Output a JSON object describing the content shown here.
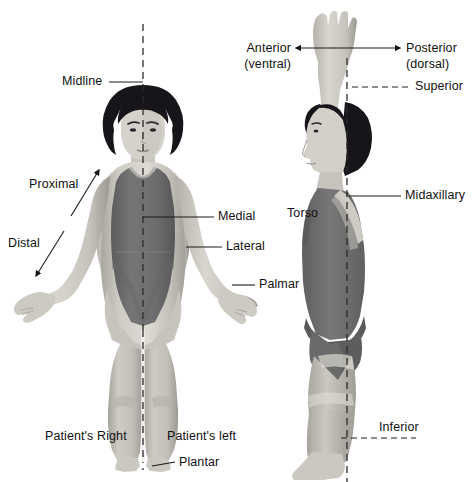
{
  "figure": {
    "background_color": "#ffffff",
    "text_color": "#111111",
    "line_color": "#1a1a1a",
    "skin_light": "#d8d5cf",
    "skin_mid": "#bfbcb5",
    "skin_shadow": "#9e9b95",
    "suit_dark": "#6f6f6f",
    "suit_darker": "#5c5c5c",
    "hair_color": "#17151a"
  },
  "labels": {
    "midline": "Midline",
    "proximal": "Proximal",
    "distal": "Distal",
    "medial": "Medial",
    "lateral": "Lateral",
    "palmar": "Palmar",
    "patients_right": "Patient's Right",
    "patients_left": "Patient's left",
    "plantar": "Plantar",
    "anterior_line1": "Anterior",
    "anterior_line2": "(ventral)",
    "posterior_line1": "Posterior",
    "posterior_line2": "(dorsal)",
    "superior": "Superior",
    "midaxillary": "Midaxillary",
    "torso": "Torso",
    "inferior": "Inferior"
  },
  "views": {
    "front": {
      "name": "anterior-view-figure",
      "description": "Woman facing forward in a dark one-piece swimsuit with a vertical dashed midline"
    },
    "side": {
      "name": "lateral-view-figure",
      "description": "Woman in profile with one arm raised overhead, vertical dashed midaxillary line"
    }
  }
}
